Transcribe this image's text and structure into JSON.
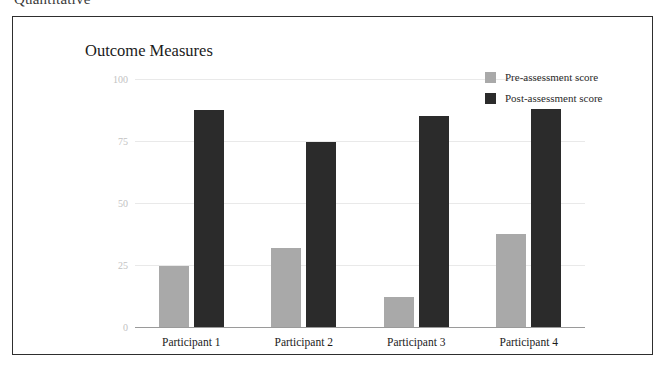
{
  "document": {
    "heading": "Quantitative"
  },
  "chart_data": {
    "type": "bar",
    "title": "Outcome Measures",
    "xlabel": "",
    "ylabel": "",
    "ylim": [
      0,
      100
    ],
    "yticks": [
      100,
      75,
      50,
      25,
      0
    ],
    "grid": true,
    "legend_position": "top-right",
    "categories": [
      "Participant 1",
      "Participant 2",
      "Participant 3",
      "Participant 4"
    ],
    "series": [
      {
        "name": "Pre-assessment score",
        "color": "#a9a9a9",
        "values": [
          24.5,
          32,
          12,
          37.5
        ]
      },
      {
        "name": "Post-assessment score",
        "color": "#2b2b2b",
        "values": [
          87.5,
          74.5,
          85,
          88
        ]
      }
    ]
  }
}
